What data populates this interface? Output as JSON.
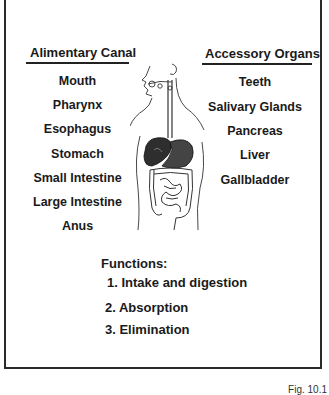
{
  "left_column": {
    "title": "Alimentary Canal",
    "items": [
      "Mouth",
      "Pharynx",
      "Esophagus",
      "Stomach",
      "Small Intestine",
      "Large Intestine",
      "Anus"
    ]
  },
  "right_column": {
    "title": "Accessory Organs",
    "items": [
      "Teeth",
      "Salivary Glands",
      "Pancreas",
      "Liver",
      "Gallbladder"
    ]
  },
  "functions": {
    "title": "Functions:",
    "items": [
      "1. Intake and digestion",
      "2. Absorption",
      "3. Elimination"
    ]
  },
  "caption": "Fig. 10.1",
  "illustration": "human-digestive-system-illustration"
}
